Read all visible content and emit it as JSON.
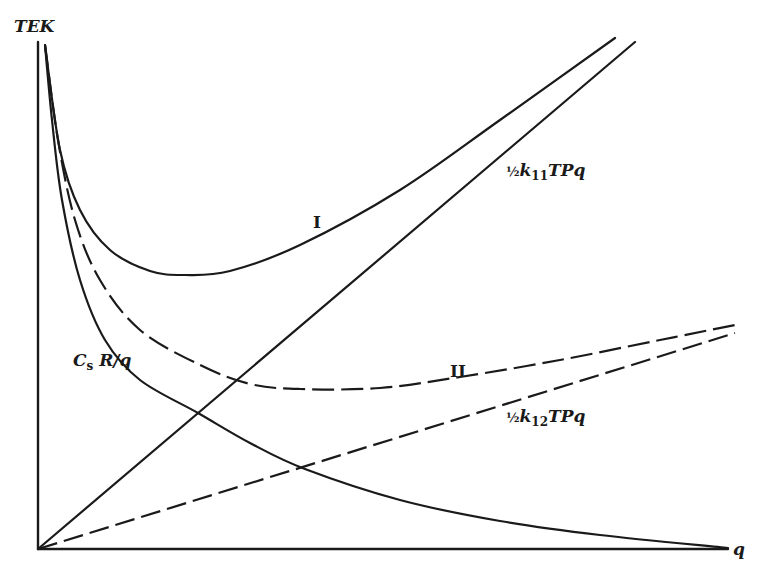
{
  "chart_data": {
    "type": "line",
    "title": "",
    "xlabel": "q",
    "ylabel": "TEK",
    "grid": false,
    "legend": "none (curves labeled inline)",
    "axes": {
      "origin_px": [
        38,
        549
      ],
      "x_end_px": 728,
      "y_end_px": 42,
      "ticks": "none"
    },
    "series": [
      {
        "name": "I",
        "label": "I",
        "style": "solid",
        "description": "Total expected cost, case I (C_sR/q + ½k11TPq)",
        "points_px": [
          [
            45,
            45
          ],
          [
            60,
            150
          ],
          [
            80,
            210
          ],
          [
            110,
            250
          ],
          [
            150,
            271
          ],
          [
            185,
            275
          ],
          [
            230,
            271
          ],
          [
            300,
            245
          ],
          [
            400,
            190
          ],
          [
            500,
            120
          ],
          [
            615,
            38
          ]
        ]
      },
      {
        "name": "II",
        "label": "II",
        "style": "dashed",
        "description": "Total expected cost, case II (C_sR/q + ½k12TPq)",
        "points_px": [
          [
            45,
            45
          ],
          [
            58,
            140
          ],
          [
            75,
            220
          ],
          [
            100,
            280
          ],
          [
            140,
            330
          ],
          [
            200,
            365
          ],
          [
            250,
            384
          ],
          [
            300,
            389
          ],
          [
            380,
            388
          ],
          [
            460,
            377
          ],
          [
            560,
            360
          ],
          [
            660,
            340
          ],
          [
            735,
            325
          ]
        ]
      },
      {
        "name": "CsR/q",
        "label_main": "C",
        "label_sub": "s",
        "label_rest": " R/q",
        "style": "solid",
        "description": "Ordering cost hyperbola",
        "points_px": [
          [
            45,
            45
          ],
          [
            52,
            120
          ],
          [
            62,
            200
          ],
          [
            80,
            280
          ],
          [
            105,
            340
          ],
          [
            140,
            380
          ],
          [
            198,
            413
          ],
          [
            250,
            443
          ],
          [
            305,
            469
          ],
          [
            400,
            500
          ],
          [
            500,
            521
          ],
          [
            600,
            535
          ],
          [
            728,
            548
          ]
        ]
      },
      {
        "name": "½k11TPq",
        "label_frac": "½",
        "label_k": "k",
        "label_sub": "11",
        "label_rest": "TPq",
        "style": "solid",
        "description": "Linear holding cost, k11",
        "points_px": [
          [
            38,
            549
          ],
          [
            635,
            42
          ]
        ]
      },
      {
        "name": "½k12TPq",
        "label_frac": "½",
        "label_k": "k",
        "label_sub": "12",
        "label_rest": "TPq",
        "style": "dashed",
        "description": "Linear holding cost, k12",
        "points_px": [
          [
            38,
            549
          ],
          [
            735,
            333
          ]
        ]
      }
    ]
  },
  "labels": {
    "y_axis": "TEK",
    "x_axis": "q",
    "curve_I": "I",
    "curve_II": "II"
  }
}
